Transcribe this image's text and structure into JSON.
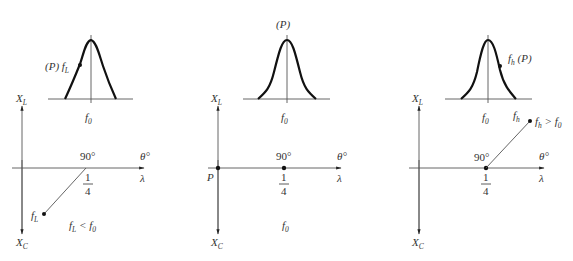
{
  "panels": [
    {
      "id": "low",
      "curve_point_label": "(P) f",
      "curve_point_sub": "L",
      "f0_label": "f",
      "f0_sub": "0",
      "axis_XL": "X",
      "axis_XL_sub": "L",
      "axis_XC": "X",
      "axis_XC_sub": "C",
      "angle_label": "90°",
      "theta_label": "θ°",
      "lambda_label": "λ",
      "frac_num": "1",
      "frac_den": "4",
      "point_label": "f",
      "point_sub": "L",
      "relation": "f",
      "relation_sub1": "L",
      "relation_op": " < f",
      "relation_sub2": "0"
    },
    {
      "id": "resonance",
      "curve_top_label": "(P)",
      "f0_label": "f",
      "f0_sub": "0",
      "axis_XL": "X",
      "axis_XL_sub": "L",
      "axis_XC": "X",
      "axis_XC_sub": "C",
      "angle_label": "90°",
      "theta_label": "θ°",
      "lambda_label": "λ",
      "frac_num": "1",
      "frac_den": "4",
      "origin_label": "P",
      "relation": "f",
      "relation_sub": "0"
    },
    {
      "id": "high",
      "curve_point_label": "f",
      "curve_point_sub": "h",
      "curve_point_suffix": " (P)",
      "f0_label": "f",
      "f0_sub": "0",
      "fh_label": "f",
      "fh_sub": "h",
      "axis_XL": "X",
      "axis_XL_sub": "L",
      "axis_XC": "X",
      "axis_XC_sub": "C",
      "angle_label": "90°",
      "theta_label": "θ°",
      "lambda_label": "λ",
      "frac_num": "1",
      "frac_den": "4",
      "relation": "f",
      "relation_sub1": "h",
      "relation_op": " > f",
      "relation_sub2": "0"
    }
  ]
}
